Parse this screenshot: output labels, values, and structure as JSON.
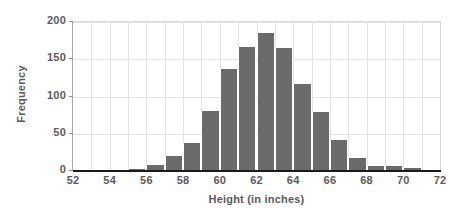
{
  "chart_data": {
    "type": "bar",
    "title": "",
    "subtitle": "",
    "xlabel": "Height (in inches)",
    "ylabel": "Frequency",
    "xlim": [
      52,
      72
    ],
    "ylim": [
      0,
      200
    ],
    "grid": true,
    "legend": false,
    "legend_position": "none",
    "bin_width": 1,
    "bar_color": "#6b6b6b",
    "axis_text_color": "#5a5a5a",
    "gridline_color": "#e3e3e3",
    "x_ticks": [
      52,
      54,
      56,
      58,
      60,
      62,
      64,
      66,
      68,
      70,
      72
    ],
    "x_tick_labels": [
      "52",
      "54",
      "56",
      "58",
      "60",
      "62",
      "64",
      "66",
      "68",
      "70",
      "72"
    ],
    "y_ticks": [
      0,
      50,
      100,
      150,
      200
    ],
    "y_tick_labels": [
      "0",
      "50",
      "100",
      "150",
      "200"
    ],
    "x_gridlines": [
      53,
      54,
      55,
      56,
      57,
      58,
      59,
      60,
      61,
      62,
      63,
      64,
      65,
      66,
      67,
      68,
      69,
      70,
      71
    ],
    "y_gridlines": [
      50,
      100,
      150,
      200
    ],
    "categories": [
      "52-53",
      "53-54",
      "54-55",
      "55-56",
      "56-57",
      "57-58",
      "58-59",
      "59-60",
      "60-61",
      "61-62",
      "62-63",
      "63-64",
      "64-65",
      "65-66",
      "66-67",
      "67-68",
      "68-69",
      "69-70",
      "70-71",
      "71-72"
    ],
    "bin_starts": [
      52,
      53,
      54,
      55,
      56,
      57,
      58,
      59,
      60,
      61,
      62,
      63,
      64,
      65,
      66,
      67,
      68,
      69,
      70,
      71
    ],
    "values": [
      0,
      0,
      0,
      3,
      8,
      20,
      38,
      81,
      137,
      167,
      185,
      165,
      117,
      79,
      42,
      18,
      7,
      7,
      4,
      0
    ]
  }
}
